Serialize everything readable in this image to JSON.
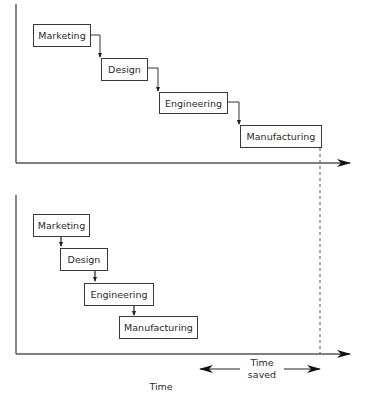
{
  "diagram": {
    "top_panel": {
      "description": "Sequential process",
      "stages": [
        {
          "label": "Marketing"
        },
        {
          "label": "Design"
        },
        {
          "label": "Engineering"
        },
        {
          "label": "Manufacturing"
        }
      ]
    },
    "bottom_panel": {
      "description": "Overlapping / concurrent process",
      "stages": [
        {
          "label": "Marketing"
        },
        {
          "label": "Design"
        },
        {
          "label": "Engineering"
        },
        {
          "label": "Manufacturing"
        }
      ]
    },
    "time_saved": {
      "line1": "Time",
      "line2": "saved"
    },
    "x_axis_label": "Time"
  },
  "colors": {
    "line": "#3a3a3a",
    "background": "#ffffff"
  }
}
